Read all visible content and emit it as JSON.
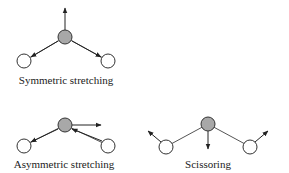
{
  "diagram": {
    "modes": [
      {
        "id": "symmetric",
        "label": "Symmetric stretching"
      },
      {
        "id": "asymmetric",
        "label": "Asymmetric stretching"
      },
      {
        "id": "scissoring",
        "label": "Scissoring"
      }
    ],
    "colors": {
      "central_atom": "#a8a8a8",
      "outer_atom": "#ffffff",
      "stroke": "#333333",
      "bond": "#555555"
    }
  }
}
